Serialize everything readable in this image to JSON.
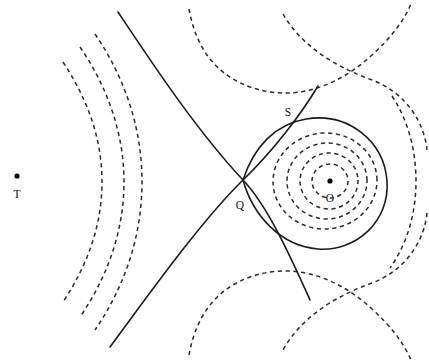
{
  "figure": {
    "type": "contour-diagram",
    "width": 429,
    "height": 364,
    "background_color": "#ffffff",
    "line_color": "#1a1a1a",
    "dash_color": "#2a2a2a"
  },
  "points": [
    {
      "id": "T",
      "label": "T",
      "role": "primary-mass-point",
      "x": 17,
      "y": 176,
      "label_x": 17,
      "label_y": 195,
      "dot_radius": 2.6
    },
    {
      "id": "O",
      "label": "O",
      "role": "secondary-mass-point",
      "x": 330,
      "y": 181,
      "label_x": 330,
      "label_y": 199,
      "dot_radius": 2.6
    },
    {
      "id": "Q",
      "label": "Q",
      "role": "saddle-point-lagrange",
      "x": 243,
      "y": 180,
      "label_x": 240,
      "label_y": 206,
      "dot_radius": 0
    },
    {
      "id": "S",
      "label": "S",
      "role": "separatrix-curve-label",
      "x": 291,
      "y": 119,
      "label_x": 288,
      "label_y": 113,
      "dot_radius": 0
    }
  ],
  "curves": {
    "solid": [
      {
        "name": "separatrix-left-branch",
        "style": "solid",
        "d": "M 118 12 C 150 60, 196 130, 243 180 C 268 206, 292 260, 310 300"
      },
      {
        "name": "separatrix-lower-left-branch",
        "style": "solid",
        "d": "M 110 347 C 145 300, 200 222, 243 180 C 272 152, 300 116, 318 86"
      },
      {
        "name": "separatrix-right-lobe",
        "style": "solid",
        "d": "M 243 180 C 254 146, 276 124, 306 119 C 348 112, 384 141, 387 181 C 390 221, 356 252, 318 249 C 281 246, 253 216, 243 180 Z"
      }
    ],
    "dashed_ovals": [
      {
        "name": "inner-oval-1",
        "cx": 330,
        "cy": 181,
        "rx": 18,
        "ry": 17,
        "rot": 0
      },
      {
        "name": "inner-oval-2",
        "cx": 329,
        "cy": 181,
        "rx": 29,
        "ry": 28,
        "rot": -2
      },
      {
        "name": "inner-oval-3",
        "cx": 327,
        "cy": 181,
        "rx": 40,
        "ry": 38,
        "rot": -3
      },
      {
        "name": "inner-oval-4",
        "cx": 325,
        "cy": 181,
        "rx": 52,
        "ry": 48,
        "rot": -4
      }
    ],
    "dashed_outer": [
      {
        "name": "outer-contour-1",
        "style": "dashed",
        "d": "M 392 96 C 408 120, 416 150, 416 181 C 416 214, 407 244, 390 268"
      },
      {
        "name": "outer-contour-2-upper",
        "style": "dashed",
        "d": "M 283 14 C 300 44, 333 66, 372 80 C 404 92, 424 120, 427 150"
      },
      {
        "name": "outer-contour-2-lower",
        "style": "dashed",
        "d": "M 427 213 C 424 243, 404 271, 372 283 C 333 297, 300 319, 283 350"
      },
      {
        "name": "outer-contour-3-upper",
        "style": "dashed",
        "d": "M 189 9 C 196 48, 216 76, 253 88 C 300 103, 343 82, 372 55 C 392 37, 404 20, 411 4"
      },
      {
        "name": "outer-contour-3-lower",
        "style": "dashed",
        "d": "M 189 355 C 196 316, 216 288, 253 276 C 300 261, 343 282, 372 309 C 392 327, 404 344, 411 360"
      }
    ],
    "dashed_left_arcs": [
      {
        "name": "left-arc-1",
        "style": "dashed",
        "d": "M 95 34 C 125 78, 142 128, 142 182 C 142 236, 125 286, 95 330"
      },
      {
        "name": "left-arc-2",
        "style": "dashed",
        "d": "M 80 47 C 108 88, 124 134, 124 182 C 124 230, 108 276, 80 317"
      },
      {
        "name": "left-arc-3",
        "style": "dashed",
        "d": "M 63 62 C 88 100, 102 139, 102 182 C 102 225, 88 264, 63 302"
      }
    ]
  }
}
